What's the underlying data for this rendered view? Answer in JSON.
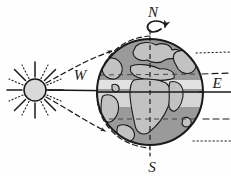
{
  "diagram": {
    "background_color": "#fefefe",
    "ink_color": "#1a1a1a",
    "labels": {
      "north": "N",
      "south": "S",
      "west": "W",
      "east": "E"
    },
    "sun": {
      "name": "sun",
      "center_x": 35,
      "center_y": 90,
      "radius": 11,
      "body_color": "#d9d9d9",
      "ray_count_solid": 8,
      "ray_count_dotted": 8
    },
    "earth": {
      "name": "earth-globe",
      "center_x": 150,
      "center_y": 92,
      "radius": 53,
      "ocean_color": "#9a9a9a",
      "land_color": "#bdbdbd",
      "tropical_band_color": "#e4e4e4",
      "equator_style": "solid",
      "axis_style": "dashed",
      "axis_label_top": "N",
      "axis_label_bottom": "S"
    },
    "rotation_arrow": {
      "name": "earth-rotation-arrow",
      "direction": "counterclockwise",
      "meaning": "west-to-east rotation"
    },
    "latitude_lines": [
      {
        "name": "arctic-circle",
        "style": "dotted",
        "y": 53
      },
      {
        "name": "tropic-of-cancer",
        "style": "dashed",
        "y": 74
      },
      {
        "name": "equator",
        "style": "solid",
        "y": 92
      },
      {
        "name": "tropic-of-capricorn",
        "style": "dashed",
        "y": 119
      },
      {
        "name": "antarctic-circle",
        "style": "dotted",
        "y": 140
      }
    ],
    "sun_rays": {
      "central_ray": {
        "name": "central-sunray",
        "style": "solid",
        "arrow": true
      },
      "upper_tangent": {
        "name": "upper-tangent-sunray",
        "style": "dashed",
        "arrow": true
      },
      "lower_tangent": {
        "name": "lower-tangent-sunray",
        "style": "dashed",
        "arrow": true
      }
    }
  }
}
